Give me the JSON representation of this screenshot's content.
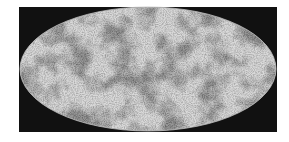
{
  "image": {
    "subject": "all-sky map in elliptical (Mollweide) projection, grayscale mottled temperature fluctuations",
    "colors": {
      "background": "#ffffff",
      "frame": "#111111",
      "map_light": "#d8d8d8",
      "map_dark": "#5a5a5a"
    }
  }
}
